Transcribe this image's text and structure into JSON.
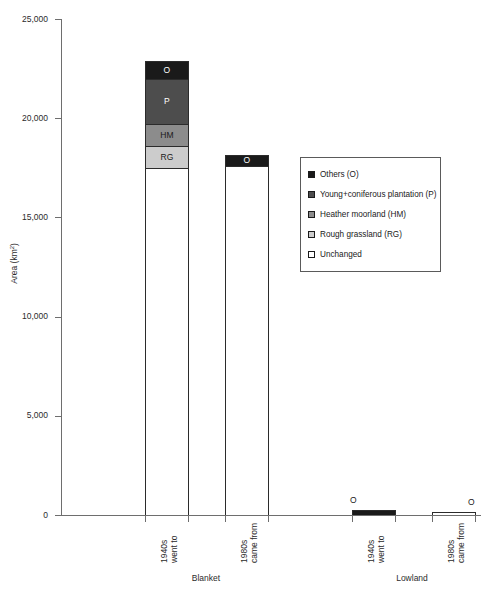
{
  "chart_data": {
    "type": "bar",
    "stacked": true,
    "title": "",
    "xlabel": "",
    "ylabel": "Area (km2)",
    "ylabel_display": "Area (km",
    "ylabel_sup": "2",
    "ylabel_tail": ")",
    "ylim": [
      0,
      25000
    ],
    "ytick_values": [
      25000,
      20000,
      15000,
      10000,
      5000,
      0
    ],
    "ytick_labels": [
      "25,000",
      "20,000",
      "15,000",
      "10,000",
      "5,000",
      "0"
    ],
    "grid": false,
    "legend_position": "center-right",
    "groups": [
      "Blanket",
      "Lowland"
    ],
    "categories": [
      "1940s went to",
      "1980s came from",
      "1940s went to",
      "1980s came from"
    ],
    "category_lines": [
      [
        "1940s",
        "went to"
      ],
      [
        "1980s",
        "came from"
      ],
      [
        "1940s",
        "went to"
      ],
      [
        "1980s",
        "came from"
      ]
    ],
    "series": [
      {
        "name": "Others (O)",
        "short": "O",
        "color": "#1a1a1a",
        "values": [
          900,
          550,
          250,
          150
        ]
      },
      {
        "name": "Young+coniferous plantation (P)",
        "short": "P",
        "color": "#4d4d4d",
        "values": [
          2300,
          0,
          0,
          0
        ]
      },
      {
        "name": "Heather moorland (HM)",
        "short": "HM",
        "color": "#8c8c8c",
        "values": [
          1100,
          0,
          0,
          0
        ]
      },
      {
        "name": "Rough grassland (RG)",
        "short": "RG",
        "color": "#cccccc",
        "values": [
          1100,
          0,
          0,
          0
        ]
      },
      {
        "name": "Unchanged",
        "short": "",
        "color": "#ffffff",
        "values": [
          17500,
          17600,
          0,
          0
        ]
      }
    ],
    "totals": [
      22900,
      18150,
      250,
      150
    ],
    "annotations": [
      {
        "text": "O",
        "bar": 3,
        "position": "above"
      },
      {
        "text": "O",
        "bar": 4,
        "position": "above"
      }
    ]
  },
  "axis": {
    "y_title_main": "Area (km",
    "y_title_sup": "2",
    "y_title_end": ")",
    "ticks": [
      {
        "label": "25,000"
      },
      {
        "label": "20,000"
      },
      {
        "label": "15,000"
      },
      {
        "label": "10,000"
      },
      {
        "label": "5,000"
      },
      {
        "label": "0"
      }
    ]
  },
  "bars": [
    {
      "group": "Blanket",
      "cat_line1": "1940s",
      "cat_line2": "went to",
      "segments": [
        {
          "key": "O",
          "label": "O",
          "value": 900,
          "color": "#1a1a1a",
          "tone": "dark"
        },
        {
          "key": "P",
          "label": "P",
          "value": 2300,
          "color": "#4d4d4d",
          "tone": "dark"
        },
        {
          "key": "HM",
          "label": "HM",
          "value": 1100,
          "color": "#8c8c8c",
          "tone": "light"
        },
        {
          "key": "RG",
          "label": "RG",
          "value": 1100,
          "color": "#cccccc",
          "tone": "light"
        },
        {
          "key": "UN",
          "label": "",
          "value": 17500,
          "color": "#ffffff",
          "tone": "light"
        }
      ]
    },
    {
      "group": "Blanket",
      "cat_line1": "1980s",
      "cat_line2": "came from",
      "segments": [
        {
          "key": "O",
          "label": "O",
          "value": 550,
          "color": "#1a1a1a",
          "tone": "dark"
        },
        {
          "key": "UN",
          "label": "",
          "value": 17600,
          "color": "#ffffff",
          "tone": "light"
        }
      ]
    },
    {
      "group": "Lowland",
      "cat_line1": "1940s",
      "cat_line2": "went to",
      "outside_label": "O",
      "segments": [
        {
          "key": "O",
          "label": "",
          "value": 250,
          "color": "#1a1a1a",
          "tone": "dark"
        }
      ]
    },
    {
      "group": "Lowland",
      "cat_line1": "1980s",
      "cat_line2": "came from",
      "outside_label": "O",
      "segments": [
        {
          "key": "UN",
          "label": "",
          "value": 150,
          "color": "#ffffff",
          "tone": "light"
        }
      ]
    }
  ],
  "group_labels": [
    {
      "text": "Blanket"
    },
    {
      "text": "Lowland"
    }
  ],
  "legend": {
    "items": [
      {
        "label": "Others (O)",
        "color": "#1a1a1a"
      },
      {
        "label": "Young+coniferous plantation (P)",
        "color": "#4d4d4d"
      },
      {
        "label": "Heather moorland (HM)",
        "color": "#8c8c8c"
      },
      {
        "label": "Rough grassland (RG)",
        "color": "#cccccc"
      },
      {
        "label": "Unchanged",
        "color": "#ffffff"
      }
    ]
  }
}
